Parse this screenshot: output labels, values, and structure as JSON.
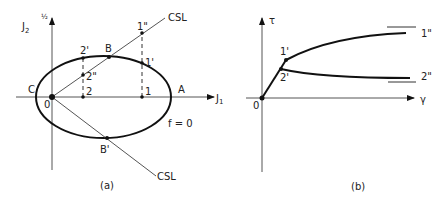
{
  "panel_a": {
    "caption": "(a)",
    "y_axis_label": "J",
    "y_axis_sub": "2",
    "y_axis_sup": "½",
    "x_axis_label": "J",
    "x_axis_sub": "1",
    "origin": "0",
    "surface_label": "f = 0",
    "csl_upper": "CSL",
    "csl_lower": "CSL",
    "points": {
      "A": "A",
      "B": "B",
      "B_prime": "B'",
      "C": "C",
      "p1": "1",
      "p1_prime": "1'",
      "p1_dprime": "1\"",
      "p2": "2",
      "p2_prime": "2'",
      "p2_dprime": "2\""
    }
  },
  "panel_b": {
    "caption": "(b)",
    "y_axis_label": "τ",
    "x_axis_label": "γ",
    "origin": "0",
    "points": {
      "p1_prime": "1'",
      "p2_prime": "2'"
    },
    "curve_labels": {
      "c1": "1\"",
      "c2": "2\""
    }
  }
}
